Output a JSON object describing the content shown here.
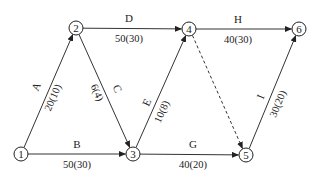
{
  "diagram": {
    "type": "activity-on-arrow network",
    "nodes": [
      {
        "id": "1",
        "label": "1",
        "x": 21,
        "y": 154
      },
      {
        "id": "2",
        "label": "2",
        "x": 76,
        "y": 28
      },
      {
        "id": "3",
        "label": "3",
        "x": 133,
        "y": 154
      },
      {
        "id": "4",
        "label": "4",
        "x": 189,
        "y": 29
      },
      {
        "id": "5",
        "label": "5",
        "x": 246,
        "y": 155
      },
      {
        "id": "6",
        "label": "6",
        "x": 299,
        "y": 29
      }
    ],
    "edges": [
      {
        "from": "1",
        "to": "2",
        "name": "A",
        "value": "20(10)",
        "style": "solid"
      },
      {
        "from": "1",
        "to": "3",
        "name": "B",
        "value": "50(30)",
        "style": "solid"
      },
      {
        "from": "2",
        "to": "3",
        "name": "C",
        "value": "6(4)",
        "style": "solid"
      },
      {
        "from": "2",
        "to": "4",
        "name": "D",
        "value": "50(30)",
        "style": "solid"
      },
      {
        "from": "3",
        "to": "4",
        "name": "E",
        "value": "10(8)",
        "style": "solid"
      },
      {
        "from": "3",
        "to": "5",
        "name": "G",
        "value": "40(20)",
        "style": "solid"
      },
      {
        "from": "4",
        "to": "6",
        "name": "H",
        "value": "40(30)",
        "style": "solid"
      },
      {
        "from": "5",
        "to": "6",
        "name": "I",
        "value": "30(20)",
        "style": "solid"
      },
      {
        "from": "4",
        "to": "5",
        "name": "",
        "value": "",
        "style": "dashed",
        "note": "dummy activity"
      }
    ]
  },
  "colors": {
    "line": "#333333",
    "text": "#222222",
    "background": "#ffffff"
  }
}
